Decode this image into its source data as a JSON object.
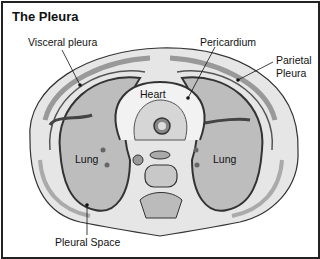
{
  "title": "The Pleura",
  "labels": {
    "visceral_pleura": "Visceral pleura",
    "pericardium": "Pericardium",
    "parietal_line1": "Parietal",
    "parietal_line2": "Pleura",
    "heart": "Heart",
    "lung_left": "Lung",
    "lung_right": "Lung",
    "pleural_space": "Pleural Space"
  },
  "colors": {
    "ink": "#222222",
    "tissue": "#cfcfcf",
    "lung": "#b8b8b8",
    "muscle": "#a8a8a8",
    "background": "#ffffff"
  }
}
